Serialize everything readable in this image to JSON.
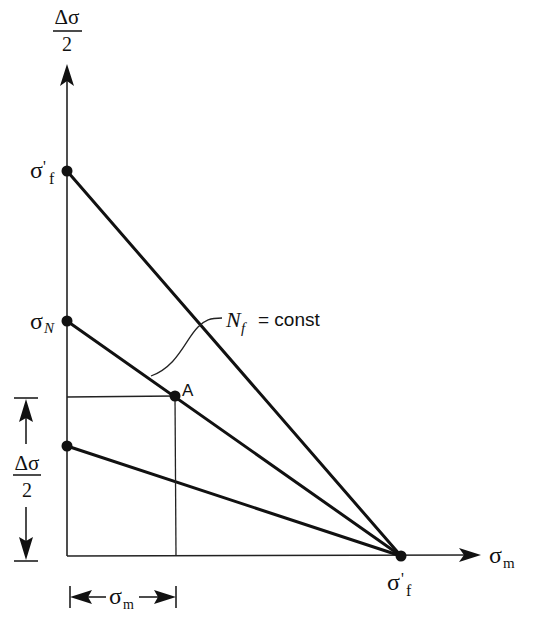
{
  "diagram": {
    "type": "constant-life diagram (Haigh diagram)",
    "y_axis": {
      "label_numerator": "Δσ",
      "label_denominator": "2"
    },
    "x_axis": {
      "label_main": "σ",
      "label_sub": "m"
    },
    "points": {
      "sigma_f_prime_y": {
        "label_main": "σ",
        "label_prime": "'",
        "label_sub": "f",
        "x": 67,
        "y": 171
      },
      "sigma_N": {
        "label_main": "σ",
        "label_sub": "N",
        "x": 67,
        "y": 321
      },
      "lower_intercept": {
        "x": 67,
        "y": 446
      },
      "A": {
        "label": "A",
        "x": 175,
        "y": 396
      },
      "sigma_f_prime_x": {
        "label_main": "σ",
        "label_prime": "'",
        "label_sub": "f",
        "x": 401,
        "y": 556
      }
    },
    "lines": [
      {
        "name": "line-sigma-f-prime",
        "from": "sigma_f_prime_y",
        "to": "sigma_f_prime_x"
      },
      {
        "name": "line-sigma-N",
        "from": "sigma_N",
        "to": "sigma_f_prime_x"
      },
      {
        "name": "line-lower",
        "from": "lower_intercept",
        "to": "sigma_f_prime_x"
      }
    ],
    "annotation": {
      "Nf_main": "N",
      "Nf_sub": "f",
      "equals_text": "= const"
    },
    "dimension_vertical": {
      "numerator": "Δσ",
      "denominator": "2"
    },
    "dimension_horizontal": {
      "label_main": "σ",
      "label_sub": "m"
    }
  }
}
